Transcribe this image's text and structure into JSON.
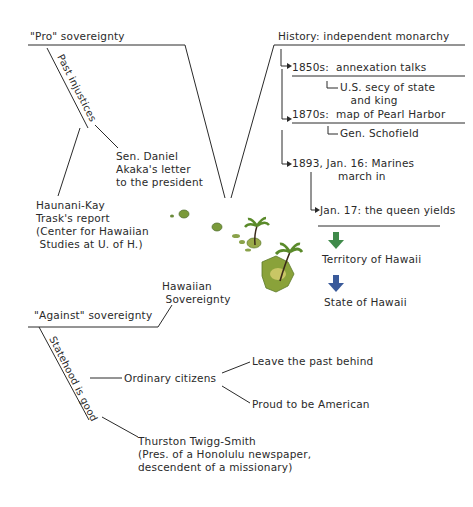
{
  "diagram": {
    "pro": {
      "heading": "\"Pro\" sovereignty",
      "branch_label": "Past injustices",
      "items": [
        "Sen. Daniel\nAkaka's letter\nto the president",
        "Haunani-Kay\nTrask's report\n(Center for Hawaiian\n Studies at U. of H.)"
      ]
    },
    "history": {
      "heading": "History: independent monarchy",
      "events": [
        {
          "label": "1850s:  annexation talks",
          "detail": "U.S. secy of state\n   and king"
        },
        {
          "label": "1870s:  map of Pearl Harbor",
          "detail": "Gen. Schofield"
        },
        {
          "label": "1893, Jan. 16: Marines\n             march in"
        },
        {
          "label": "Jan. 17: the queen yields"
        }
      ],
      "outcomes": [
        "Territory of Hawaii",
        "State of Hawaii"
      ],
      "arrow_colors": [
        "#3f8a4a",
        "#3a5a9a"
      ]
    },
    "center": {
      "label": "Hawaiian\n Sovereignty",
      "image": "hawaiian-islands-with-palm-trees"
    },
    "against": {
      "heading": "\"Against\" sovereignty",
      "branch_label": "Statehood is good",
      "sub": {
        "label": "Ordinary citizens",
        "items": [
          "Leave the past behind",
          "Proud to be American"
        ]
      },
      "person": "Thurston Twigg-Smith\n(Pres. of a Honolulu newspaper,\ndescendent of a missionary)"
    },
    "colors": {
      "ink": "#2a2a2a",
      "island_green": "#7a9a3a",
      "island_light": "#d8d070",
      "palm": "#5a8a2a"
    }
  }
}
